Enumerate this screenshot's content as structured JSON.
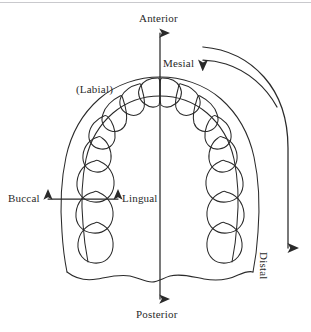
{
  "diagram": {
    "type": "anatomical-line-diagram",
    "background_color": "#ffffff",
    "line_color": "#2a2a2a",
    "text_color": "#2a2a2a",
    "scan_line_color": "#c9c9cd"
  },
  "labels": {
    "anterior": "Anterior",
    "posterior": "Posterior",
    "mesial": "Mesial",
    "distal": "Distal",
    "buccal": "Buccal",
    "lingual": "Lingual",
    "labial": "(Labial)"
  },
  "axes": {
    "vertical": {
      "from_label": "Anterior",
      "to_label": "Posterior",
      "arrowheads": "both",
      "orientation": "vertical"
    },
    "horizontal": {
      "from_label": "Buccal",
      "to_label": "Lingual",
      "arrowheads": "both",
      "orientation": "horizontal"
    },
    "mesial_arc": {
      "label": "Mesial",
      "arrowhead": "left",
      "shape": "arc"
    },
    "distal_arc": {
      "label": "Distal",
      "arrowhead": "down",
      "shape": "arc"
    }
  },
  "arch": {
    "description": "Maxillary dental arch, occlusal view",
    "teeth_per_quadrant": 8,
    "total_teeth": 16,
    "quadrants": [
      "left",
      "right"
    ],
    "tooth_types": [
      "central incisor",
      "lateral incisor",
      "canine",
      "first premolar",
      "second premolar",
      "first molar",
      "second molar",
      "third molar"
    ]
  }
}
